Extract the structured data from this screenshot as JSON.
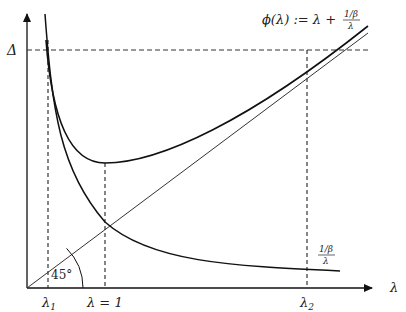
{
  "diagram": {
    "title": "",
    "axes": {
      "x_label": "λ",
      "y_label": "",
      "y_tick_label": "Δ"
    },
    "curves": [
      {
        "name": "phi",
        "label_lhs": "ϕ(λ) := λ + ",
        "label_frac_num": "1/β",
        "label_frac_den": "λ"
      },
      {
        "name": "inverse",
        "label_frac_num": "1/β",
        "label_frac_den": "λ"
      },
      {
        "name": "diagonal",
        "label": "45°"
      }
    ],
    "x_ticks": [
      {
        "label_main": "λ",
        "label_sub": "1"
      },
      {
        "label_main": "λ = 1",
        "label_sub": ""
      },
      {
        "label_main": "λ",
        "label_sub": "2"
      }
    ],
    "angle_label": "45°",
    "colors": {
      "line": "#1a1a1a",
      "thin_line": "#333333",
      "dash": "#333333"
    }
  }
}
